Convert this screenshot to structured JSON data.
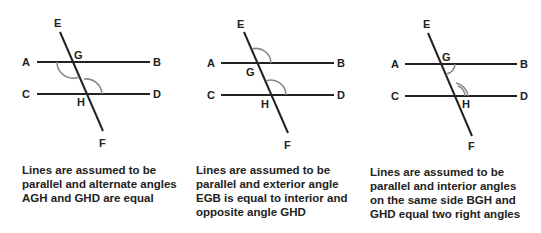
{
  "panels": [
    {
      "id": "alternate",
      "labels": {
        "E": "E",
        "A": "A",
        "G": "G",
        "B": "B",
        "C": "C",
        "H": "H",
        "D": "D",
        "F": "F"
      },
      "caption": "Lines are assumed to be\nparallel and alternate angles\nAGH and GHD are equal",
      "marked_angles": [
        "AGH",
        "GHD"
      ]
    },
    {
      "id": "exterior",
      "labels": {
        "E": "E",
        "A": "A",
        "G": "G",
        "B": "B",
        "C": "C",
        "H": "H",
        "D": "D",
        "F": "F"
      },
      "caption": "Lines are assumed to be\nparallel and exterior angle\nEGB is equal to interior and\nopposite angle GHD",
      "marked_angles": [
        "EGB",
        "GHD"
      ]
    },
    {
      "id": "interior",
      "labels": {
        "E": "E",
        "A": "A",
        "G": "G",
        "B": "B",
        "C": "C",
        "H": "H",
        "D": "D",
        "F": "F"
      },
      "caption": "Lines are assumed to be\nparallel and interior angles\non the same side BGH and\nGHD equal two right angles",
      "marked_angles": [
        "BGH",
        "GHD"
      ]
    }
  ]
}
